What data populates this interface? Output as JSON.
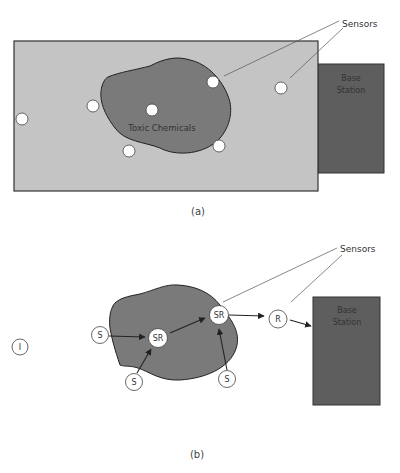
{
  "figure_a": {
    "caption": "(a)",
    "field_color": "#c4c4c4",
    "region_color": "#7a7a7a",
    "base_station_color": "#5e5e5e",
    "region_label": "Toxic Chemicals",
    "base_station_label_line1": "Base",
    "base_station_label_line2": "Station",
    "callout_label": "Sensors",
    "sensor_count": 7
  },
  "figure_b": {
    "caption": "(b)",
    "region_color": "#7a7a7a",
    "base_station_color": "#5e5e5e",
    "base_station_label_line1": "Base",
    "base_station_label_line2": "Station",
    "callout_label": "Sensors",
    "nodes": [
      {
        "id": "i1",
        "label": "I"
      },
      {
        "id": "s1",
        "label": "S"
      },
      {
        "id": "s2",
        "label": "S"
      },
      {
        "id": "s3",
        "label": "S"
      },
      {
        "id": "sr1",
        "label": "SR"
      },
      {
        "id": "sr2",
        "label": "SR"
      },
      {
        "id": "r1",
        "label": "R"
      }
    ],
    "edges": [
      {
        "from": "s1",
        "to": "sr1"
      },
      {
        "from": "s2",
        "to": "sr1"
      },
      {
        "from": "sr1",
        "to": "sr2"
      },
      {
        "from": "s3",
        "to": "sr2"
      },
      {
        "from": "sr2",
        "to": "r1"
      },
      {
        "from": "r1",
        "to": "base_station"
      }
    ]
  }
}
